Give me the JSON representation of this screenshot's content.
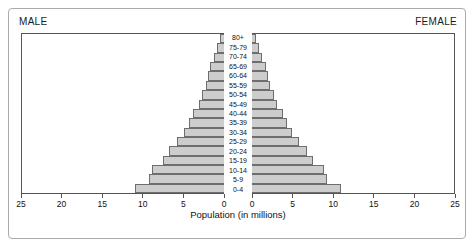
{
  "figure": {
    "male_label": "MALE",
    "female_label": "FEMALE",
    "axis_title": "Population (in millions)"
  },
  "chart_data": {
    "type": "bar",
    "subtype": "population-pyramid",
    "title": "",
    "xlabel": "Population (in millions)",
    "ylabel": "",
    "xlim": [
      0,
      25
    ],
    "xticks": [
      0,
      5,
      10,
      15,
      20,
      25
    ],
    "xtick_labels": [
      "0",
      "5",
      "10",
      "15",
      "20",
      "25"
    ],
    "grid": false,
    "legend_position": "top-corners",
    "bar_fill_color": "#cdcdcd",
    "bar_border_color": "#6e6e6e",
    "frame_color": "#555555",
    "categories": [
      "80+",
      "75-79",
      "70-74",
      "65-69",
      "60-64",
      "55-59",
      "50-54",
      "45-49",
      "40-44",
      "35-39",
      "30-34",
      "25-29",
      "20-24",
      "15-19",
      "10-14",
      "5-9",
      "0-4"
    ],
    "series": [
      {
        "name": "MALE",
        "side": "left",
        "values": [
          0.5,
          0.9,
          1.3,
          1.7,
          2.0,
          2.3,
          2.7,
          3.1,
          3.8,
          4.3,
          5.0,
          5.8,
          6.9,
          7.6,
          8.9,
          9.3,
          11.1
        ]
      },
      {
        "name": "FEMALE",
        "side": "right",
        "values": [
          0.5,
          0.9,
          1.3,
          1.7,
          2.0,
          2.3,
          2.7,
          3.1,
          3.8,
          4.3,
          5.0,
          5.8,
          6.9,
          7.6,
          8.9,
          9.3,
          11.1
        ]
      }
    ]
  }
}
